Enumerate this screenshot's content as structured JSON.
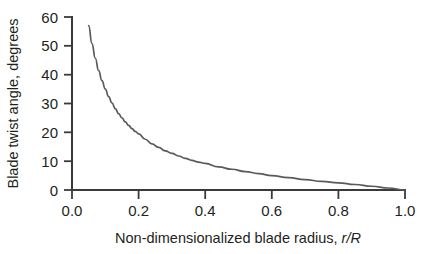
{
  "figure": {
    "background_color": "#ffffff",
    "axis_color": "#3a3a3a",
    "curve_color": "#5a5a5a",
    "text_color": "#231f20"
  },
  "chart_data": {
    "type": "line",
    "title": "",
    "subtitle": "",
    "xlabel_plain": "Non-dimensionalized blade radius, ",
    "xlabel_italic": "r/R",
    "xlabel": "Non-dimensionalized blade radius, r/R",
    "ylabel": "Blade twist angle, degrees",
    "xlim": [
      0.0,
      1.0
    ],
    "ylim": [
      0,
      60
    ],
    "xticks": [
      0.0,
      0.2,
      0.4,
      0.6,
      0.8,
      1.0
    ],
    "xtick_labels": [
      "0.0",
      "0.2",
      "0.4",
      "0.6",
      "0.8",
      "1.0"
    ],
    "yticks": [
      0,
      10,
      20,
      30,
      40,
      50,
      60
    ],
    "ytick_labels": [
      "0",
      "10",
      "20",
      "30",
      "40",
      "50",
      "60"
    ],
    "grid": false,
    "legend": null,
    "legend_position": "none",
    "annotations": [],
    "series": [
      {
        "name": "Blade twist distribution",
        "color": "#5a5a5a",
        "x": [
          0.05,
          0.06,
          0.07,
          0.08,
          0.09,
          0.1,
          0.11,
          0.12,
          0.13,
          0.14,
          0.15,
          0.16,
          0.17,
          0.18,
          0.19,
          0.2,
          0.22,
          0.24,
          0.26,
          0.28,
          0.3,
          0.32,
          0.34,
          0.36,
          0.38,
          0.4,
          0.44,
          0.48,
          0.52,
          0.56,
          0.6,
          0.65,
          0.7,
          0.75,
          0.8,
          0.85,
          0.9,
          0.95,
          1.0
        ],
        "y": [
          57.0,
          50.8,
          45.7,
          41.4,
          37.9,
          35.0,
          32.4,
          30.2,
          28.2,
          26.5,
          25.0,
          23.6,
          22.4,
          21.3,
          20.3,
          19.5,
          17.6,
          16.0,
          14.8,
          13.6,
          12.7,
          11.8,
          11.0,
          10.3,
          9.7,
          9.2,
          8.0,
          7.2,
          6.4,
          5.7,
          5.0,
          4.3,
          3.6,
          3.0,
          2.5,
          1.9,
          1.3,
          0.7,
          0.0
        ]
      }
    ]
  }
}
